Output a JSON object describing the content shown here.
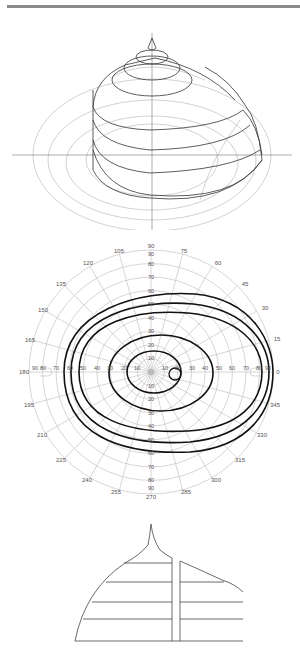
{
  "figure": {
    "header_rule": true,
    "panels": [
      {
        "id": "hill-of-vision-3d",
        "description": "3D hill of vision with contour rings"
      },
      {
        "id": "polar-isopter-chart",
        "description": "Polar perimetry chart with isopters"
      },
      {
        "id": "hill-cross-section",
        "description": "Vertical cross-section of hill of vision with blind spot gap"
      }
    ]
  },
  "polar": {
    "meridian_labels": [
      "0",
      "15",
      "30",
      "45",
      "60",
      "75",
      "90",
      "105",
      "120",
      "135",
      "150",
      "165",
      "180",
      "195",
      "210",
      "225",
      "240",
      "255",
      "270",
      "285",
      "300",
      "315",
      "330",
      "345"
    ],
    "radial_labels_right": [
      "10",
      "20",
      "30",
      "40",
      "50",
      "60",
      "70",
      "80",
      "90"
    ],
    "radial_labels_left": [
      "10",
      "20",
      "30",
      "40",
      "50",
      "60",
      "70",
      "80",
      "90"
    ],
    "radial_labels_up": [
      "10",
      "20",
      "30",
      "40",
      "50",
      "60",
      "70",
      "80",
      "90"
    ],
    "radial_labels_down": [
      "10",
      "20",
      "30",
      "40",
      "50",
      "60",
      "70",
      "80",
      "90"
    ],
    "colors": {
      "grid": "#b8b8b8",
      "isopter": "#111111",
      "label": "#555555"
    }
  }
}
